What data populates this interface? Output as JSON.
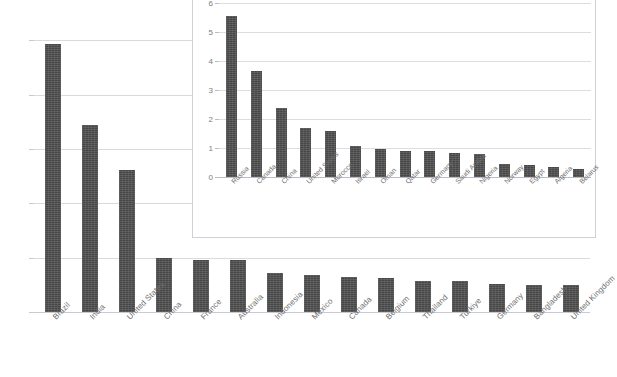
{
  "chart_data": [
    {
      "id": "main",
      "type": "bar",
      "title": "",
      "xlabel": "",
      "ylabel": "",
      "ylim": [
        0,
        30
      ],
      "yticks": [
        0,
        5,
        10,
        15,
        20,
        25,
        30
      ],
      "grid": true,
      "legend": "none",
      "bar_color": "#474747",
      "grid_color": "#d9d9e2",
      "categories": [
        "Brazil",
        "India",
        "United States",
        "China",
        "France",
        "Australia",
        "Indonesia",
        "Mexico",
        "Canada",
        "Belgium",
        "Thailand",
        "Turkiye",
        "Germany",
        "Bangladesh",
        "United Kingdom"
      ],
      "values": [
        24.7,
        17.2,
        13.1,
        5.0,
        4.8,
        4.75,
        3.6,
        3.4,
        3.2,
        3.1,
        2.9,
        2.85,
        2.6,
        2.5,
        2.45
      ]
    },
    {
      "id": "inset",
      "type": "bar",
      "title": "",
      "xlabel": "",
      "ylabel": "",
      "ylim": [
        0,
        6
      ],
      "yticks": [
        0,
        1,
        2,
        3,
        4,
        5,
        6
      ],
      "grid": true,
      "legend": "none",
      "bar_color": "#474747",
      "grid_color": "#dcdce4",
      "frame_color": "#cfcfd8",
      "categories": [
        "Russia",
        "Canada",
        "China",
        "United States",
        "Morocco",
        "Israel",
        "Oman",
        "Qatar",
        "Germany",
        "Saudi Arabia",
        "Nigeria",
        "Norway",
        "Egypt",
        "Algeria",
        "Belarus"
      ],
      "values": [
        5.55,
        3.67,
        2.38,
        1.68,
        1.6,
        1.08,
        0.98,
        0.88,
        0.88,
        0.83,
        0.8,
        0.45,
        0.42,
        0.35,
        0.28
      ]
    }
  ]
}
